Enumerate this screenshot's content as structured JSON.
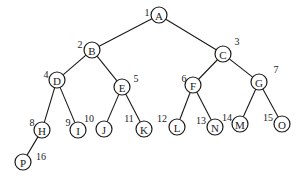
{
  "diagram": {
    "type": "binary-tree",
    "node_radius": 8,
    "nodes": [
      {
        "id": "A",
        "index": "1",
        "x": 159,
        "y": 15,
        "nx": 147,
        "ny": 12
      },
      {
        "id": "B",
        "index": "2",
        "x": 92,
        "y": 50,
        "nx": 80,
        "ny": 44
      },
      {
        "id": "C",
        "index": "3",
        "x": 223,
        "y": 54,
        "nx": 237,
        "ny": 41
      },
      {
        "id": "D",
        "index": "4",
        "x": 57,
        "y": 80,
        "nx": 46,
        "ny": 74
      },
      {
        "id": "E",
        "index": "5",
        "x": 122,
        "y": 87,
        "nx": 136,
        "ny": 78
      },
      {
        "id": "F",
        "index": "6",
        "x": 193,
        "y": 85,
        "nx": 184,
        "ny": 78
      },
      {
        "id": "G",
        "index": "7",
        "x": 259,
        "y": 82,
        "nx": 276,
        "ny": 69
      },
      {
        "id": "H",
        "index": "8",
        "x": 42,
        "y": 130,
        "nx": 32,
        "ny": 122
      },
      {
        "id": "I",
        "index": "9",
        "x": 78,
        "y": 130,
        "nx": 68,
        "ny": 122
      },
      {
        "id": "J",
        "index": "10",
        "x": 104,
        "y": 129,
        "nx": 89,
        "ny": 118
      },
      {
        "id": "K",
        "index": "11",
        "x": 144,
        "y": 129,
        "nx": 129,
        "ny": 118
      },
      {
        "id": "L",
        "index": "12",
        "x": 177,
        "y": 127,
        "nx": 162,
        "ny": 118
      },
      {
        "id": "N",
        "index": "13",
        "x": 215,
        "y": 127,
        "nx": 201,
        "ny": 120
      },
      {
        "id": "M",
        "index": "14",
        "x": 240,
        "y": 124,
        "nx": 227,
        "ny": 117
      },
      {
        "id": "O",
        "index": "15",
        "x": 282,
        "y": 124,
        "nx": 268,
        "ny": 117
      },
      {
        "id": "P",
        "index": "16",
        "x": 23,
        "y": 162,
        "nx": 41,
        "ny": 156
      }
    ],
    "edges": [
      [
        "A",
        "B"
      ],
      [
        "A",
        "C"
      ],
      [
        "B",
        "D"
      ],
      [
        "B",
        "E"
      ],
      [
        "C",
        "F"
      ],
      [
        "C",
        "G"
      ],
      [
        "D",
        "H"
      ],
      [
        "D",
        "I"
      ],
      [
        "E",
        "J"
      ],
      [
        "E",
        "K"
      ],
      [
        "F",
        "L"
      ],
      [
        "F",
        "N"
      ],
      [
        "G",
        "M"
      ],
      [
        "G",
        "O"
      ],
      [
        "H",
        "P"
      ]
    ]
  }
}
